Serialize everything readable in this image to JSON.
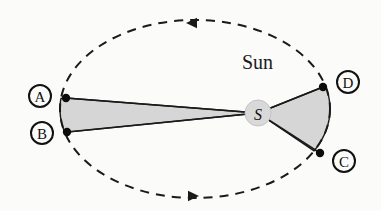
{
  "figure": {
    "background_color": "#fbfbfa",
    "stroke_color": "#1a1a1a",
    "sector_fill_color": "#d6d6d6",
    "sun_disc_color": "#d9d9d9"
  },
  "orbit": {
    "name": "dashed-elliptical-orbit",
    "center_x": 195,
    "center_y": 109,
    "radius_x": 135,
    "radius_y": 89,
    "style": "dashed",
    "dash_pattern": "9 7",
    "stroke_width": 2
  },
  "sun": {
    "label": "Sun",
    "marker_letter": "S",
    "x": 258,
    "y": 113,
    "radius": 13,
    "label_x": 242,
    "label_y": 69
  },
  "direction_arrows": [
    {
      "name": "orbit-arrow-top",
      "x": 197,
      "y": 22,
      "direction": "left",
      "meaning": "counterclockwise"
    },
    {
      "name": "orbit-arrow-bottom",
      "x": 188,
      "y": 196,
      "direction": "right",
      "meaning": "counterclockwise"
    }
  ],
  "orbit_points": [
    {
      "id": "A",
      "label": "A",
      "point_x": 66,
      "point_y": 98,
      "label_x": 40,
      "label_y": 96,
      "label_radius": 11
    },
    {
      "id": "B",
      "label": "B",
      "point_x": 67,
      "point_y": 132,
      "label_x": 42,
      "label_y": 133,
      "label_radius": 11
    },
    {
      "id": "C",
      "label": "C",
      "point_x": 320,
      "point_y": 153,
      "label_x": 344,
      "label_y": 161,
      "label_radius": 11
    },
    {
      "id": "D",
      "label": "D",
      "point_x": 323,
      "point_y": 87,
      "label_x": 348,
      "label_y": 82,
      "label_radius": 11
    }
  ],
  "swept_sectors": [
    {
      "name": "sector-A-B",
      "from_point": "A",
      "to_point": "B",
      "apex": "S",
      "description": "narrow long sector at aphelion swept from A to B"
    },
    {
      "name": "sector-C-D",
      "from_point": "D",
      "to_point": "C",
      "apex": "S",
      "description": "wide short sector at perihelion swept from D to C"
    }
  ]
}
